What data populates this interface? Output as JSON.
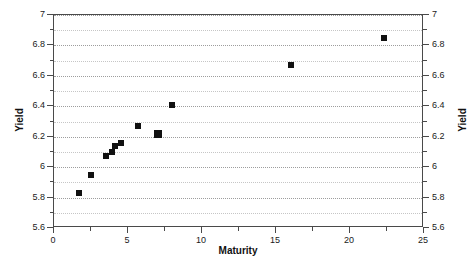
{
  "chart_data": {
    "type": "scatter",
    "title": "",
    "xlabel": "Maturity",
    "ylabel": "Yield",
    "ylabel_right": "Yield",
    "xlim": [
      0,
      25
    ],
    "ylim": [
      5.6,
      7
    ],
    "grid": true,
    "legend": null,
    "x_ticks": [
      0,
      5,
      10,
      15,
      20,
      25
    ],
    "x_tick_labels": [
      "0",
      "5",
      "10",
      "15",
      "20",
      "25"
    ],
    "x_minor_step": 2.5,
    "y_ticks": [
      5.6,
      5.8,
      6,
      6.2,
      6.4,
      6.6,
      6.8,
      7
    ],
    "y_tick_labels": [
      "5.6",
      "5.8",
      "6",
      "6.2",
      "6.4",
      "6.6",
      "6.8",
      "7"
    ],
    "y_minor_step": 0.1,
    "marker": "square",
    "marker_color": "#111111",
    "points": [
      {
        "x": 1.7,
        "y": 5.83,
        "size": "small"
      },
      {
        "x": 2.5,
        "y": 5.95,
        "size": "small"
      },
      {
        "x": 3.5,
        "y": 6.07,
        "size": "small"
      },
      {
        "x": 3.9,
        "y": 6.1,
        "size": "small"
      },
      {
        "x": 4.1,
        "y": 6.14,
        "size": "small"
      },
      {
        "x": 4.5,
        "y": 6.16,
        "size": "small"
      },
      {
        "x": 5.7,
        "y": 6.27,
        "size": "small"
      },
      {
        "x": 7.0,
        "y": 6.22,
        "size": "big"
      },
      {
        "x": 8.0,
        "y": 6.41,
        "size": "small"
      },
      {
        "x": 16.0,
        "y": 6.67,
        "size": "small"
      },
      {
        "x": 22.3,
        "y": 6.85,
        "size": "small"
      }
    ]
  },
  "style": {
    "frame_color": "#4a4a4a",
    "grid_color": "#8d8d8d",
    "background": "#ffffff",
    "text_color": "#111111"
  }
}
